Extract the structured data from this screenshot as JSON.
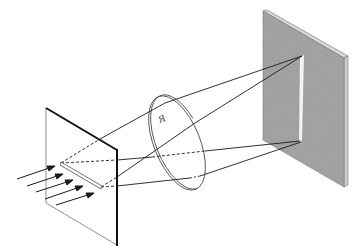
{
  "figure": {
    "lens_label": "R",
    "colors": {
      "ink": "#1a1a1a",
      "screen_gray": "#9a9a98",
      "screen_edge": "#d8d8d6",
      "slit_image": "#f4f4f2",
      "background": "#ffffff"
    },
    "components": [
      {
        "name": "incident-light",
        "count": 5
      },
      {
        "name": "slit-screen"
      },
      {
        "name": "lens"
      },
      {
        "name": "projection-screen"
      }
    ]
  }
}
